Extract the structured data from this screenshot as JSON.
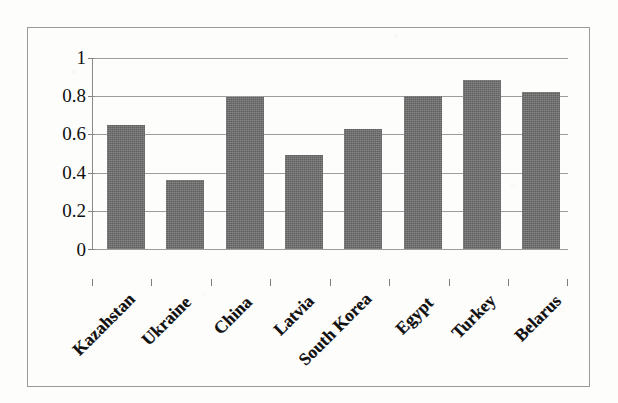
{
  "chart_data": {
    "type": "bar",
    "title": "",
    "subtitle": "",
    "xlabel": "",
    "ylabel": "",
    "categories": [
      "Kazahstan",
      "Ukraine",
      "China",
      "Latvia",
      "South Korea",
      "Egypt",
      "Turkey",
      "Belarus"
    ],
    "values": [
      0.65,
      0.36,
      0.795,
      0.49,
      0.63,
      0.8,
      0.885,
      0.82
    ],
    "ylim": [
      0,
      1
    ],
    "ytick_labels": [
      "1",
      "0.8",
      "0.6",
      "0.4",
      "0.2",
      "0"
    ],
    "ytick_values": [
      1,
      0.8,
      0.6,
      0.4,
      0.2,
      0
    ],
    "grid": true,
    "legend": "none",
    "legend_position": "none",
    "series": [
      {
        "name": "",
        "values": [
          0.65,
          0.36,
          0.795,
          0.49,
          0.63,
          0.8,
          0.885,
          0.82
        ]
      }
    ],
    "colors": {
      "bar_fill": "#6c6c6c",
      "gridline": "#8d8d8d",
      "axis": "#8a8a8a",
      "text": "#111111",
      "background": "#fdfdfc",
      "frame_border": "#9a9a9a"
    },
    "x_label_rotation_degrees": -45
  }
}
